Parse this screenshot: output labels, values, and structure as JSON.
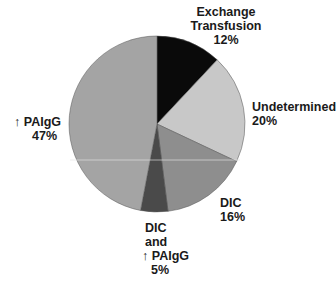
{
  "chart_data": {
    "type": "pie",
    "title": "",
    "start_angle_deg": 0,
    "direction": "clockwise",
    "grid": false,
    "legend": "none (direct labels)",
    "slices": [
      {
        "label": "Exchange Transfusion",
        "value": 12,
        "display": "12%",
        "color": "#0a0a0a"
      },
      {
        "label": "Undetermined",
        "value": 20,
        "display": "20%",
        "color": "#c8c8c8"
      },
      {
        "label": "DIC",
        "value": 16,
        "display": "16%",
        "color": "#8e8e8e"
      },
      {
        "label": "DIC and ↑ PAIgG",
        "value": 5,
        "display": "5%",
        "color": "#4a4a4a"
      },
      {
        "label": "↑ PAIgG",
        "value": 47,
        "display": "47%",
        "color": "#a4a4a4"
      }
    ],
    "categories": [
      "Exchange Transfusion",
      "Undetermined",
      "DIC",
      "DIC and ↑ PAIgG",
      "↑ PAIgG"
    ],
    "values": [
      12,
      20,
      16,
      5,
      47
    ]
  },
  "labels": {
    "exchange": {
      "line1": "Exchange",
      "line2": "Transfusion",
      "pct": "12%"
    },
    "undetermined": {
      "line1": "Undetermined",
      "pct": "20%"
    },
    "dic": {
      "line1": "DIC",
      "pct": "16%"
    },
    "dic_paigg": {
      "line1": "DIC",
      "line2": "and",
      "line3": "↑ PAIgG",
      "pct": "5%"
    },
    "paigg": {
      "line1": "↑ PAIgG",
      "pct": "47%"
    }
  }
}
